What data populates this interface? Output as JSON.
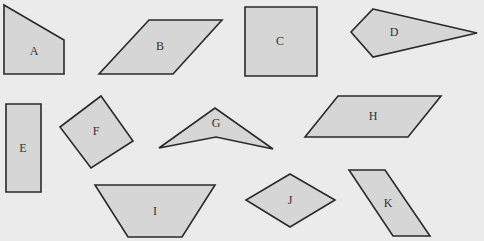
{
  "diagram": {
    "background": "#ebebeb",
    "fill_color": "#d6d6d6",
    "stroke_color": "#2a2a2a",
    "shapes": [
      {
        "label": "A",
        "type": "pentagon-quad",
        "points": "4,5 64,40 64,74 4,74",
        "label_pos": [
          34,
          52
        ]
      },
      {
        "label": "B",
        "type": "parallelogram",
        "points": "149,20 222,20 173,74 99,74",
        "label_pos": [
          160,
          47
        ]
      },
      {
        "label": "C",
        "type": "square",
        "points": "245,7 317,7 317,76 245,76",
        "label_pos": [
          280,
          42
        ]
      },
      {
        "label": "D",
        "type": "kite",
        "points": "373,9 477,33 373,57 351,32",
        "label_pos": [
          394,
          33
        ]
      },
      {
        "label": "E",
        "type": "rectangle",
        "points": "6,104 41,104 41,192 6,192",
        "label_pos": [
          23,
          149
        ]
      },
      {
        "label": "F",
        "type": "rotated-square",
        "points": "101,96 133,141 91,168 60,127",
        "label_pos": [
          96,
          132
        ]
      },
      {
        "label": "G",
        "type": "dart",
        "points": "159,148 215,108 273,149 216,137",
        "label_pos": [
          216,
          124
        ]
      },
      {
        "label": "H",
        "type": "parallelogram",
        "points": "338,96 441,96 408,137 305,137",
        "label_pos": [
          373,
          117
        ]
      },
      {
        "label": "I",
        "type": "trapezoid",
        "points": "95,185 215,185 182,237 128,237",
        "label_pos": [
          155,
          212
        ]
      },
      {
        "label": "J",
        "type": "rhombus",
        "points": "290,174 335,200 290,227 246,200",
        "label_pos": [
          290,
          201
        ]
      },
      {
        "label": "K",
        "type": "parallelogram",
        "points": "349,170 385,170 430,236 393,236",
        "label_pos": [
          388,
          204
        ]
      }
    ]
  }
}
